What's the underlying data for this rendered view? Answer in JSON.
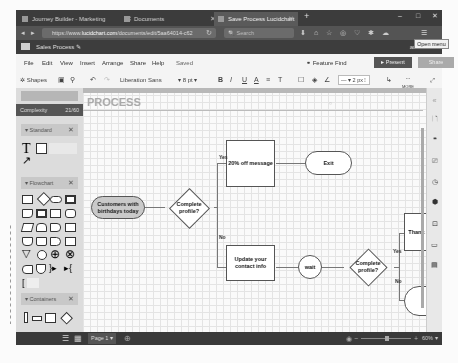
{
  "browser": {
    "tabs": [
      {
        "label": "Journey Builder - Marketing",
        "active": false
      },
      {
        "label": "Documents",
        "active": false
      },
      {
        "label": "Save Process Lucidchart",
        "active": true
      }
    ],
    "new_tab": "+",
    "url_prefix": "https://www.",
    "url_domain": "lucidchart.com",
    "url_rest": "/documents/edit/5aa64014-c62",
    "search_placeholder": "Search",
    "tooltip": "Open menu",
    "window_controls": [
      "–",
      "□",
      "✕"
    ]
  },
  "app": {
    "document_name": "Sales Process",
    "user": "amanda ▾",
    "menu": [
      "File",
      "Edit",
      "View",
      "Insert",
      "Arrange",
      "Share",
      "Help"
    ],
    "save_status": "Saved",
    "feature_find": "Feature Find",
    "present": "▸ Present",
    "share": "Share"
  },
  "toolbar": {
    "shapes_label": "Shapes",
    "font": "Liberation Sans",
    "font_size": "8",
    "font_unit": "pt",
    "bold": "B",
    "italic": "I",
    "underline": "U",
    "text_color": "A",
    "align": "≡",
    "strike": "T",
    "line_width": "2 px",
    "more": "MORE"
  },
  "left_panel": {
    "complexity_label": "Complexity",
    "complexity_value": "21/60",
    "sections": [
      {
        "label": "▾ Standard"
      },
      {
        "label": "▾ Flowchart"
      },
      {
        "label": "▾ Containers"
      }
    ]
  },
  "canvas": {
    "title": "PROCESS",
    "nodes": {
      "start": "Customers with birthdays today",
      "decision1": "Complete profile?",
      "offer": "20% off message",
      "exit": "Exit",
      "update": "Update your contact info",
      "wait": "wait",
      "decision2": "Complete profile?",
      "thanks": "Thank 20%",
      "exit2": "E"
    },
    "edge_labels": {
      "yes1": "Yes",
      "no1": "No",
      "yes2": "Yes",
      "no2": "No"
    }
  },
  "footer": {
    "page": "Page 1 ▾",
    "zoom_minus": "−",
    "zoom_plus": "+",
    "zoom": "60% ▾"
  }
}
